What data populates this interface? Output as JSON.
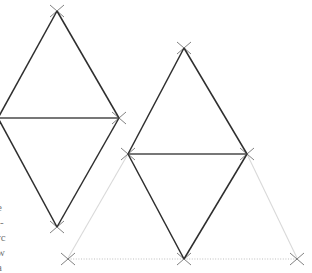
{
  "figure": {
    "canvas": {
      "width": 312,
      "height": 273,
      "background": "#ffffff"
    },
    "colors": {
      "solid_stroke": "#2b2b2b",
      "faint_stroke": "#d8d8d8",
      "dotted_stroke": "#c4c4c4",
      "marker_stroke": "#3a3a3a",
      "text": "#5a5a5a"
    },
    "points": {
      "left_rhombus_apex": {
        "x": 57,
        "y": 11
      },
      "left_rhombus_left": {
        "x": -1,
        "y": 118
      },
      "left_rhombus_right": {
        "x": 119,
        "y": 118
      },
      "left_rhombus_bottom": {
        "x": 57,
        "y": 227
      },
      "right_rhombus_apex": {
        "x": 184,
        "y": 48
      },
      "right_rhombus_left": {
        "x": 128,
        "y": 154
      },
      "right_rhombus_right": {
        "x": 247,
        "y": 154
      },
      "right_rhombus_bottom": {
        "x": 184,
        "y": 259
      },
      "baseline_left": {
        "x": 68,
        "y": 259
      },
      "baseline_right": {
        "x": 297,
        "y": 259
      }
    },
    "markers": [
      {
        "name": "marker-left-apex",
        "x": 57,
        "y": 11
      },
      {
        "name": "marker-left-right-vertex",
        "x": 119,
        "y": 118
      },
      {
        "name": "marker-left-bottom",
        "x": 57,
        "y": 227
      },
      {
        "name": "marker-right-apex",
        "x": 184,
        "y": 48
      },
      {
        "name": "marker-right-left-vertex",
        "x": 128,
        "y": 154
      },
      {
        "name": "marker-right-right-vertex",
        "x": 247,
        "y": 154
      },
      {
        "name": "marker-right-bottom",
        "x": 184,
        "y": 259
      },
      {
        "name": "marker-baseline-left",
        "x": 68,
        "y": 259
      },
      {
        "name": "marker-baseline-right",
        "x": 297,
        "y": 259
      }
    ],
    "margin_text_lines": [
      "e",
      "l-",
      "rc",
      "w",
      "a"
    ]
  }
}
